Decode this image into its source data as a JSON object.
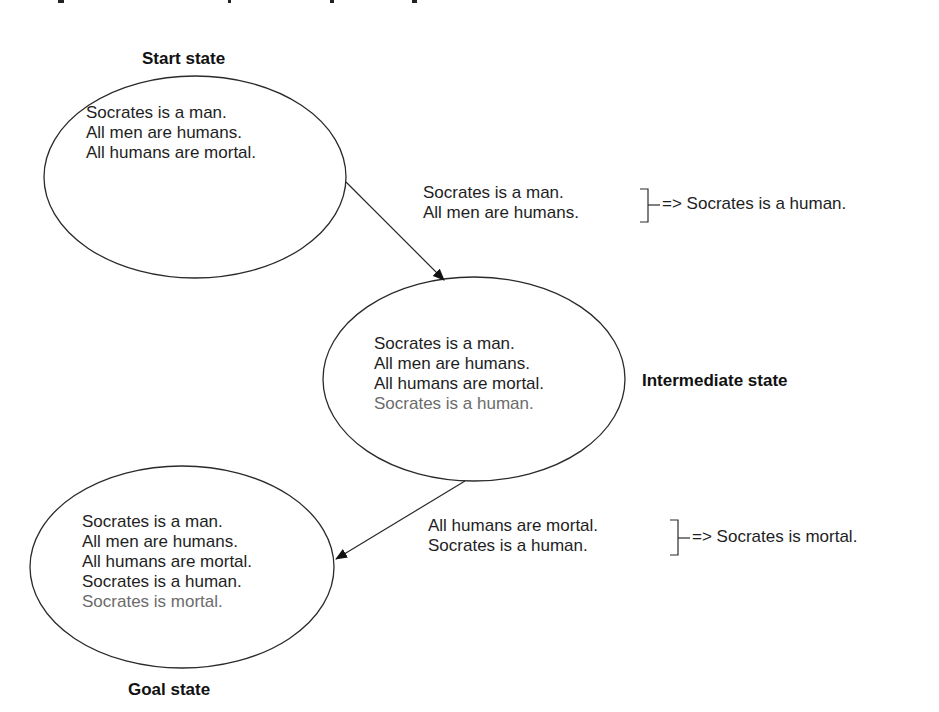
{
  "colors": {
    "text": "#1e1e1e",
    "derived_text": "#6b6b6b",
    "stroke": "#2a2a2a",
    "background": "#ffffff"
  },
  "states": {
    "start": {
      "label": "Start state",
      "facts": [
        "Socrates is a man.",
        "All men are humans.",
        "All humans are mortal."
      ]
    },
    "intermediate": {
      "label": "Intermediate state",
      "facts": [
        "Socrates is a man.",
        "All men are humans.",
        "All humans are mortal."
      ],
      "derived": "Socrates is a human."
    },
    "goal": {
      "label": "Goal state",
      "facts": [
        "Socrates is a man.",
        "All men are humans.",
        "All humans are mortal.",
        "Socrates is a human."
      ],
      "derived": "Socrates is mortal."
    }
  },
  "inferences": [
    {
      "premises": [
        "Socrates is a man.",
        "All men are humans."
      ],
      "arrow": "=>",
      "conclusion": "Socrates is a human."
    },
    {
      "premises": [
        "All humans are mortal.",
        "Socrates is a human."
      ],
      "arrow": "=>",
      "conclusion": "Socrates is mortal."
    }
  ],
  "transitions": [
    {
      "from": "start",
      "to": "intermediate"
    },
    {
      "from": "intermediate",
      "to": "goal"
    }
  ]
}
